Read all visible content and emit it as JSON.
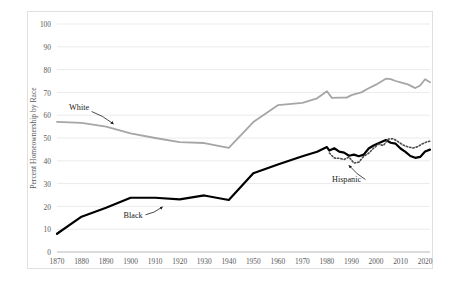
{
  "chart_data": {
    "type": "line",
    "title": "",
    "xlabel": "",
    "ylabel": "Percent Homeownership by Race",
    "xlim": [
      1870,
      2022
    ],
    "ylim": [
      0,
      100
    ],
    "yticks": [
      0,
      10,
      20,
      30,
      40,
      50,
      60,
      70,
      80,
      90,
      100
    ],
    "xticks": [
      1870,
      1880,
      1890,
      1900,
      1910,
      1920,
      1930,
      1940,
      1950,
      1960,
      1970,
      1980,
      1990,
      2000,
      2010,
      2020
    ],
    "ytick_labels": [
      "0",
      "10",
      "20",
      "30",
      "40",
      "50",
      "60",
      "70",
      "80",
      "90",
      "100"
    ],
    "xtick_labels": [
      "1870",
      "1880",
      "1890",
      "1900",
      "1910",
      "1920",
      "1930",
      "1940",
      "1950",
      "1960",
      "1970",
      "1980",
      "1990",
      "2000",
      "2010",
      "2020"
    ],
    "grid": "horizontal",
    "legend": "inline-annotations",
    "series": [
      {
        "name": "White",
        "color": "#a6a6a6",
        "style": "solid",
        "width": 1.8,
        "points": [
          [
            1870,
            57.1
          ],
          [
            1880,
            56.6
          ],
          [
            1890,
            55.0
          ],
          [
            1900,
            52.0
          ],
          [
            1910,
            50.0
          ],
          [
            1920,
            48.2
          ],
          [
            1930,
            47.8
          ],
          [
            1940,
            45.7
          ],
          [
            1950,
            57.0
          ],
          [
            1960,
            64.4
          ],
          [
            1970,
            65.4
          ],
          [
            1976,
            67.4
          ],
          [
            1980,
            70.5
          ],
          [
            1982,
            67.6
          ],
          [
            1985,
            67.7
          ],
          [
            1988,
            67.7
          ],
          [
            1990,
            68.8
          ],
          [
            1994,
            70.0
          ],
          [
            1997,
            71.8
          ],
          [
            2000,
            73.4
          ],
          [
            2004,
            76.0
          ],
          [
            2006,
            75.8
          ],
          [
            2008,
            75.0
          ],
          [
            2010,
            74.4
          ],
          [
            2013,
            73.5
          ],
          [
            2016,
            71.9
          ],
          [
            2018,
            73.0
          ],
          [
            2020,
            75.8
          ],
          [
            2022,
            74.4
          ]
        ]
      },
      {
        "name": "Black",
        "color": "#000000",
        "style": "solid",
        "width": 2.2,
        "points": [
          [
            1870,
            8.0
          ],
          [
            1880,
            15.5
          ],
          [
            1890,
            19.4
          ],
          [
            1900,
            23.8
          ],
          [
            1910,
            23.8
          ],
          [
            1920,
            23.1
          ],
          [
            1930,
            24.8
          ],
          [
            1940,
            22.8
          ],
          [
            1950,
            34.5
          ],
          [
            1960,
            38.4
          ],
          [
            1970,
            42.0
          ],
          [
            1976,
            44.0
          ],
          [
            1980,
            46.0
          ],
          [
            1981,
            44.5
          ],
          [
            1983,
            45.5
          ],
          [
            1985,
            44.0
          ],
          [
            1987,
            43.6
          ],
          [
            1989,
            42.2
          ],
          [
            1991,
            42.7
          ],
          [
            1993,
            42.0
          ],
          [
            1995,
            42.7
          ],
          [
            1997,
            45.4
          ],
          [
            1999,
            46.7
          ],
          [
            2001,
            47.7
          ],
          [
            2004,
            49.1
          ],
          [
            2006,
            47.9
          ],
          [
            2008,
            47.5
          ],
          [
            2010,
            45.4
          ],
          [
            2012,
            43.9
          ],
          [
            2014,
            42.1
          ],
          [
            2016,
            41.3
          ],
          [
            2018,
            41.7
          ],
          [
            2020,
            44.1
          ],
          [
            2022,
            44.9
          ]
        ]
      },
      {
        "name": "Hispanic",
        "color": "#4d4d4d",
        "style": "dotted",
        "width": 1.6,
        "points": [
          [
            1981,
            43.4
          ],
          [
            1983,
            41.2
          ],
          [
            1985,
            41.1
          ],
          [
            1987,
            40.6
          ],
          [
            1989,
            41.6
          ],
          [
            1991,
            39.0
          ],
          [
            1993,
            39.4
          ],
          [
            1995,
            42.0
          ],
          [
            1997,
            43.3
          ],
          [
            1999,
            45.5
          ],
          [
            2001,
            47.3
          ],
          [
            2003,
            46.7
          ],
          [
            2005,
            49.5
          ],
          [
            2007,
            49.7
          ],
          [
            2009,
            48.4
          ],
          [
            2011,
            46.9
          ],
          [
            2013,
            46.1
          ],
          [
            2015,
            45.6
          ],
          [
            2017,
            46.2
          ],
          [
            2019,
            47.5
          ],
          [
            2021,
            48.4
          ],
          [
            2022,
            48.6
          ]
        ]
      }
    ],
    "annotations": [
      {
        "label": "White",
        "x": 1879,
        "y": 62.5,
        "arrow_to": [
          1893,
          56.2
        ]
      },
      {
        "label": "Black",
        "x": 1901,
        "y": 15.0,
        "arrow_to": [
          1913,
          19.8
        ]
      },
      {
        "label": "Hispanic",
        "x": 1988,
        "y": 30.5,
        "arrow_to": [
          1989,
          38.0
        ]
      }
    ]
  }
}
